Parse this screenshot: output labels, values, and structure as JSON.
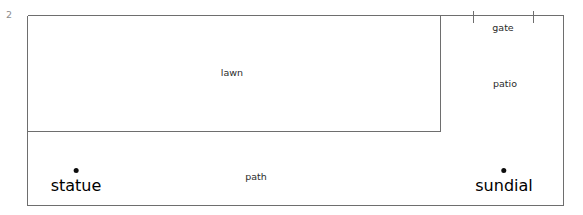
{
  "figure": {
    "number": "2",
    "number_color": "#8d8d8d",
    "line_color": "#6e6e6e",
    "text_color": "#2b2b2b",
    "background_color": "#ffffff",
    "width": 583,
    "height": 215
  },
  "regions": [
    {
      "id": "lawn",
      "label": "lawn",
      "label_x": 232,
      "label_y": 68,
      "bounds": {
        "x": 27,
        "y": 15,
        "width": 413,
        "height": 116
      }
    },
    {
      "id": "patio",
      "label": "patio",
      "label_x": 505,
      "label_y": 79,
      "bounds": {
        "x": 440,
        "y": 15,
        "width": 123,
        "height": 190
      }
    },
    {
      "id": "path",
      "label": "path",
      "label_x": 256,
      "label_y": 172,
      "bounds": {
        "x": 27,
        "y": 131,
        "width": 536,
        "height": 74
      }
    }
  ],
  "openings": [
    {
      "id": "gate",
      "label": "gate",
      "label_x": 503,
      "label_y": 23,
      "tick_left_x": 473,
      "tick_right_x": 533,
      "tick_y_top": 10,
      "tick_y_bottom": 22
    }
  ],
  "markers": [
    {
      "id": "statue",
      "label": "statue",
      "x": 76,
      "y": 168
    },
    {
      "id": "sundial",
      "label": "sundial",
      "x": 504,
      "y": 168
    }
  ]
}
